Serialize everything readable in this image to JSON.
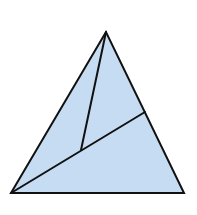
{
  "diagram": {
    "type": "geometry",
    "fill_color": "#c6dcf2",
    "stroke_color": "#111111",
    "stroke_width": 2,
    "points": {
      "apex": [
        106,
        32
      ],
      "bottom_left": [
        11,
        193
      ],
      "bottom_right": [
        184,
        193
      ],
      "right_side_point": [
        145,
        112
      ],
      "interior_point": [
        81,
        150
      ]
    },
    "segments": [
      {
        "from": "bottom_left",
        "to": "right_side_point"
      },
      {
        "from": "apex",
        "to": "interior_point"
      }
    ]
  }
}
